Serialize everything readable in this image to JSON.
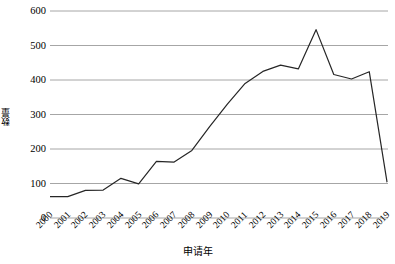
{
  "chart_data": {
    "type": "line",
    "title": "",
    "xlabel": "申请年",
    "ylabel": "数量",
    "categories": [
      "2000",
      "2001",
      "2002",
      "2003",
      "2004",
      "2005",
      "2006",
      "2007",
      "2008",
      "2009",
      "2010",
      "2011",
      "2012",
      "2013",
      "2014",
      "2015",
      "2016",
      "2017",
      "2018",
      "2019"
    ],
    "values": [
      62,
      62,
      80,
      81,
      115,
      99,
      164,
      162,
      196,
      265,
      330,
      390,
      425,
      443,
      432,
      546,
      416,
      403,
      424,
      105
    ],
    "series": [
      {
        "name": "数量",
        "values": [
          62,
          62,
          80,
          81,
          115,
          99,
          164,
          162,
          196,
          265,
          330,
          390,
          425,
          443,
          432,
          546,
          416,
          403,
          424,
          105
        ]
      }
    ],
    "ylim": [
      0,
      600
    ],
    "yticks": [
      0,
      100,
      200,
      300,
      400,
      500,
      600
    ],
    "ytick_labels": [
      "0",
      "100",
      "200",
      "300",
      "400",
      "500",
      "600"
    ],
    "grid": "horizontal",
    "legend": "none",
    "line_color": "#262626",
    "grid_color": "#a6a6a6",
    "background": "#ffffff"
  }
}
